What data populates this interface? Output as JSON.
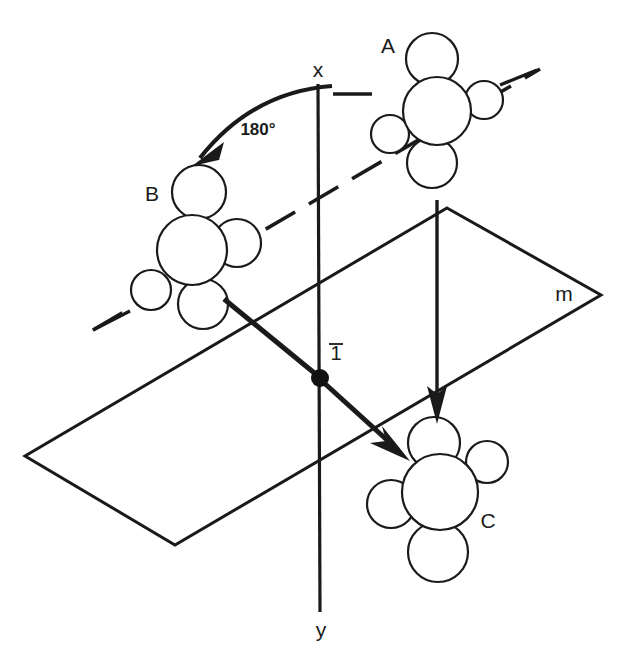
{
  "figure": {
    "background_color": "#ffffff",
    "ink_color": "#1a1a1a",
    "width": 619,
    "height": 666
  },
  "axes": {
    "x_label": "x",
    "y_label": "y",
    "vertical_axis": {
      "top_x": 318,
      "top_y": 84,
      "bottom_x": 320,
      "bottom_y": 612
    },
    "x_label_pos": {
      "x": 318,
      "y": 71
    },
    "y_label_pos": {
      "x": 321,
      "y": 630
    }
  },
  "symmetry_elements": {
    "inversion_center": {
      "label": "1",
      "has_overbar": true,
      "label_pos": {
        "x": 336,
        "y": 354
      },
      "dot": {
        "cx": 320,
        "cy": 378,
        "r": 9
      }
    },
    "mirror_plane": {
      "label": "m",
      "label_pos": {
        "x": 564,
        "y": 295
      },
      "vertices": [
        {
          "x": 447,
          "y": 208
        },
        {
          "x": 601,
          "y": 295
        },
        {
          "x": 175,
          "y": 545
        },
        {
          "x": 25,
          "y": 456
        }
      ]
    },
    "rotation": {
      "label": "180°",
      "label_pos": {
        "x": 258,
        "y": 131
      },
      "arc_start": {
        "x": 322,
        "y": 86
      },
      "arc_end": {
        "x": 196,
        "y": 163
      }
    }
  },
  "molecules": [
    {
      "id": "A",
      "label": "A",
      "label_pos": {
        "x": 388,
        "y": 47
      },
      "atoms": [
        {
          "name": "central",
          "cx": 437,
          "cy": 111,
          "r": 34
        },
        {
          "name": "top",
          "cx": 432,
          "cy": 59,
          "r": 26
        },
        {
          "name": "right-small",
          "cx": 484,
          "cy": 100,
          "r": 19
        },
        {
          "name": "bottom",
          "cx": 432,
          "cy": 163,
          "r": 25
        },
        {
          "name": "left-small",
          "cx": 390,
          "cy": 134,
          "r": 19
        }
      ],
      "bonds": [
        {
          "x1": 500,
          "y1": 83,
          "x2": 535,
          "y2": 70
        },
        {
          "x1": 370,
          "y1": 93,
          "x2": 335,
          "y2": 93
        }
      ]
    },
    {
      "id": "B",
      "label": "B",
      "label_pos": {
        "x": 152,
        "y": 195
      },
      "atoms": [
        {
          "name": "central",
          "cx": 192,
          "cy": 250,
          "r": 35
        },
        {
          "name": "top",
          "cx": 199,
          "cy": 192,
          "r": 27
        },
        {
          "name": "right-small",
          "cx": 237,
          "cy": 243,
          "r": 24
        },
        {
          "name": "bottom",
          "cx": 203,
          "cy": 304,
          "r": 25
        },
        {
          "name": "left-small",
          "cx": 151,
          "cy": 290,
          "r": 20
        }
      ],
      "bonds": [
        {
          "x1": 128,
          "y1": 312,
          "x2": 93,
          "y2": 330
        },
        {
          "x1": 256,
          "y1": 224,
          "x2": 292,
          "y2": 210
        }
      ]
    },
    {
      "id": "C",
      "label": "C",
      "label_pos": {
        "x": 488,
        "y": 522
      },
      "atoms": [
        {
          "name": "central",
          "cx": 440,
          "cy": 492,
          "r": 38
        },
        {
          "name": "top",
          "cx": 434,
          "cy": 443,
          "r": 26
        },
        {
          "name": "right-small",
          "cx": 487,
          "cy": 462,
          "r": 21
        },
        {
          "name": "bottom",
          "cx": 438,
          "cy": 552,
          "r": 30
        },
        {
          "name": "left-small",
          "cx": 391,
          "cy": 504,
          "r": 24
        }
      ],
      "bonds": []
    }
  ],
  "connectors": {
    "dashed_line": {
      "description": "dashed molecular axis through B and A",
      "x1": 93,
      "y1": 330,
      "x2": 540,
      "y2": 69
    },
    "mapping_arrows": [
      {
        "name": "inversion-arrow",
        "from": {
          "x": 224,
          "y": 299
        },
        "through": {
          "x": 320,
          "y": 378
        },
        "to": {
          "x": 404,
          "y": 456
        }
      },
      {
        "name": "mirror-arrow",
        "from": {
          "x": 437,
          "y": 200
        },
        "to": {
          "x": 438,
          "y": 420
        }
      }
    ]
  },
  "labels_summary": {
    "items": [
      "A",
      "B",
      "C",
      "m",
      "x",
      "y",
      "180°",
      "1 (inversion)"
    ]
  }
}
